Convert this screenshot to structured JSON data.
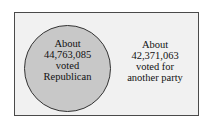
{
  "diagram": {
    "type": "venn",
    "universe": {
      "fill": "#f1f1f1",
      "border": "#4a4a4a"
    },
    "circle": {
      "fill": "#c8c8c8",
      "label_lines": [
        "About",
        "44,763,085",
        "voted",
        "Republican"
      ]
    },
    "outside": {
      "label_lines": [
        "About",
        "42,371,063",
        "voted for",
        "another party"
      ]
    }
  }
}
